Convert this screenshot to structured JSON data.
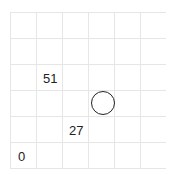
{
  "board": {
    "columns": 6,
    "rows": 6,
    "cell_size": 26,
    "grid_color": "#e6e6e6",
    "cells": [
      {
        "label": "51",
        "col": 1,
        "row": 2
      },
      {
        "label": "27",
        "col": 2,
        "row": 4
      },
      {
        "label": "0",
        "col": 0,
        "row": 5
      }
    ],
    "circle_marker": {
      "col": 3,
      "row": 3
    }
  }
}
